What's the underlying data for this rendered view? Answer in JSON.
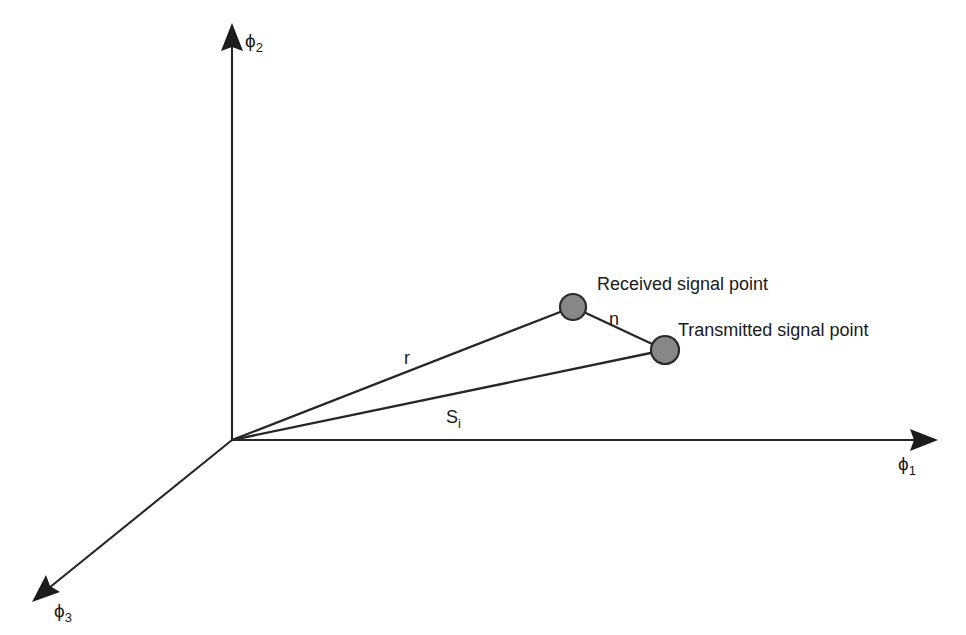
{
  "figure": {
    "background_color": "#ffffff",
    "line_color": "#262626",
    "dot_fill_color": "#878787",
    "dot_stroke_color": "#2b2b2b",
    "axes": [
      {
        "id": "phi1",
        "label_base": "ϕ",
        "label_sub": "1",
        "direction": "right",
        "origin": [
          232,
          440
        ],
        "tip": [
          938,
          440
        ],
        "label_pos": [
          898,
          470
        ]
      },
      {
        "id": "phi2",
        "label_base": "ϕ",
        "label_sub": "2",
        "direction": "up",
        "origin": [
          232,
          440
        ],
        "tip": [
          232,
          23
        ],
        "label_pos": [
          245,
          47
        ]
      },
      {
        "id": "phi3",
        "label_base": "ϕ",
        "label_sub": "3",
        "direction": "down-left",
        "origin": [
          232,
          440
        ],
        "tip": [
          32,
          602
        ],
        "label_pos": [
          54,
          617
        ]
      }
    ],
    "points": [
      {
        "id": "received-signal-point",
        "label": "Received signal point",
        "center": [
          573,
          307
        ],
        "radius": 13,
        "label_pos": [
          597,
          290
        ]
      },
      {
        "id": "transmitted-signal-point",
        "label": "Transmitted signal point",
        "center": [
          665,
          350
        ],
        "radius": 14,
        "label_pos": [
          678,
          336
        ]
      }
    ],
    "vectors": [
      {
        "id": "r-vector",
        "label": "r",
        "from": [
          232,
          440
        ],
        "to": [
          573,
          307
        ],
        "label_pos": [
          404,
          364
        ]
      },
      {
        "id": "si-vector",
        "label_base": "S",
        "label_sub": "i",
        "from": [
          232,
          440
        ],
        "to": [
          665,
          350
        ],
        "label_pos": [
          446,
          423
        ]
      },
      {
        "id": "n-vector",
        "label": "n",
        "from": [
          573,
          307
        ],
        "to": [
          665,
          350
        ],
        "label_pos": [
          609,
          325
        ]
      }
    ]
  }
}
